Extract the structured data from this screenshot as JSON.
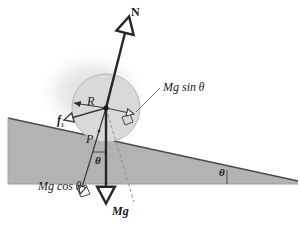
{
  "figure": {
    "type": "physics-free-body-diagram",
    "background_color": "#ffffff",
    "incline_fill": "#b3b3b3",
    "incline_stroke": "#4d4d4d",
    "disk_fill": "#d9d9d9",
    "disk_stroke": "#b0b0b0",
    "vector_color": "#262626",
    "dashed_color": "#8c8c8c",
    "thin_color": "#555555"
  },
  "labels": {
    "normal_force": "N",
    "radius": "R",
    "mg_sin_theta": "Mg sin θ",
    "friction": "f",
    "friction_subscript": "s",
    "contact_point": "P",
    "theta_incline_angle": "θ",
    "theta_weight_angle": "θ",
    "mg_cos_theta": "Mg cos θ",
    "weight": "Mg"
  },
  "geometry": {
    "incline_top_left": [
      8,
      118
    ],
    "incline_top_right": [
      298,
      181
    ],
    "incline_bottom_left": [
      8,
      184
    ],
    "incline_bottom_right": [
      298,
      184
    ],
    "disk_center": [
      106,
      108
    ],
    "disk_radius": 34,
    "contact_point": [
      99,
      131
    ],
    "incline_angle_degrees": 12,
    "vectors": [
      {
        "name": "N",
        "from": [
          106,
          108
        ],
        "to": [
          128,
          14
        ],
        "style": "thick-solid",
        "arrow": "open"
      },
      {
        "name": "Mg",
        "from": [
          106,
          108
        ],
        "to": [
          106,
          205
        ],
        "style": "thick-solid",
        "arrow": "open"
      },
      {
        "name": "Mg sin theta",
        "from": [
          106,
          108
        ],
        "to": [
          133,
          114
        ],
        "style": "thin-solid",
        "arrow": "open"
      },
      {
        "name": "Mg cos theta",
        "from": [
          106,
          108
        ],
        "to": [
          79,
          196
        ],
        "style": "thin-solid",
        "arrow": "open"
      },
      {
        "name": "f_s",
        "from": [
          106,
          108
        ],
        "to": [
          62,
          121
        ],
        "style": "thin-solid",
        "arrow": "open"
      },
      {
        "name": "R",
        "from": [
          106,
          108
        ],
        "to": [
          72,
          103
        ],
        "style": "thin-solid",
        "arrow": "closed"
      },
      {
        "name": "resultant-dashed",
        "from": [
          106,
          108
        ],
        "to": [
          134,
          202
        ],
        "style": "dashed",
        "arrow": "none"
      }
    ]
  }
}
